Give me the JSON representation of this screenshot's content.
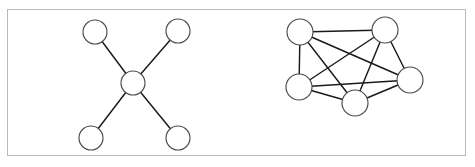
{
  "figure": {
    "border_color": "#b9b9b9",
    "background_color": "#ffffff",
    "node_fill": "#ffffff",
    "node_stroke": "#4a4a4a",
    "edge_color": "#1a1a1a",
    "frame": {
      "x": 7,
      "y": 9,
      "width": 459,
      "height": 147
    }
  },
  "graphs": [
    {
      "id": "star-graph",
      "name": "star-graph",
      "type": "star",
      "node_radius": 12,
      "nodes": [
        {
          "id": "S1",
          "name": "star-node-top-left",
          "cx": 95,
          "cy": 32
        },
        {
          "id": "S2",
          "name": "star-node-top-right",
          "cx": 178,
          "cy": 31
        },
        {
          "id": "S3",
          "name": "star-node-center",
          "cx": 133,
          "cy": 83
        },
        {
          "id": "S4",
          "name": "star-node-bottom-left",
          "cx": 91,
          "cy": 138
        },
        {
          "id": "S5",
          "name": "star-node-bottom-right",
          "cx": 178,
          "cy": 138
        }
      ],
      "edges": [
        {
          "from": "S3",
          "to": "S1"
        },
        {
          "from": "S3",
          "to": "S2"
        },
        {
          "from": "S3",
          "to": "S4"
        },
        {
          "from": "S3",
          "to": "S5"
        }
      ]
    },
    {
      "id": "complete-graph",
      "name": "complete-graph",
      "type": "complete",
      "node_radius": 13,
      "nodes": [
        {
          "id": "K1",
          "name": "complete-node-top-left",
          "cx": 300,
          "cy": 32
        },
        {
          "id": "K2",
          "name": "complete-node-top-right",
          "cx": 385,
          "cy": 30
        },
        {
          "id": "K3",
          "name": "complete-node-right",
          "cx": 410,
          "cy": 80
        },
        {
          "id": "K4",
          "name": "complete-node-bottom-center",
          "cx": 355,
          "cy": 103
        },
        {
          "id": "K5",
          "name": "complete-node-bottom-left",
          "cx": 299,
          "cy": 87
        }
      ],
      "edges": [
        {
          "from": "K1",
          "to": "K2"
        },
        {
          "from": "K1",
          "to": "K3"
        },
        {
          "from": "K1",
          "to": "K4"
        },
        {
          "from": "K1",
          "to": "K5"
        },
        {
          "from": "K2",
          "to": "K3"
        },
        {
          "from": "K2",
          "to": "K4"
        },
        {
          "from": "K2",
          "to": "K5"
        },
        {
          "from": "K3",
          "to": "K4"
        },
        {
          "from": "K3",
          "to": "K5"
        },
        {
          "from": "K4",
          "to": "K5"
        }
      ]
    }
  ]
}
